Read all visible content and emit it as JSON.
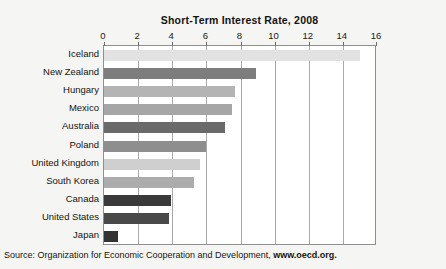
{
  "chart_data": {
    "type": "bar",
    "orientation": "horizontal",
    "title": "Short-Term Interest Rate, 2008",
    "xlabel": "",
    "ylabel": "",
    "xlim": [
      0,
      16
    ],
    "xticks": [
      0,
      2,
      4,
      6,
      8,
      10,
      12,
      14,
      16
    ],
    "grid": true,
    "legend": false,
    "categories": [
      "Iceland",
      "New Zealand",
      "Hungary",
      "Mexico",
      "Australia",
      "Poland",
      "United Kingdom",
      "South Korea",
      "Canada",
      "United States",
      "Japan"
    ],
    "values": [
      15.0,
      8.9,
      7.7,
      7.5,
      7.1,
      6.0,
      5.6,
      5.3,
      3.9,
      3.8,
      0.8
    ],
    "bar_colors": [
      "#e2e2e2",
      "#7d7d7d",
      "#b4b4b4",
      "#a6a6a6",
      "#6a6a6a",
      "#8e8e8e",
      "#cfcfcf",
      "#acacac",
      "#3a3a3a",
      "#494949",
      "#333333"
    ]
  },
  "source": {
    "prefix": "Source: Organization for Economic Cooperation and Development, ",
    "url": "www.oecd.org."
  },
  "colors": {
    "page_background": "#f5f5f3",
    "plot_background": "#ffffff",
    "frame": "#8f8f8f",
    "gridline": "#a9a9a9",
    "text": "#15130f"
  }
}
